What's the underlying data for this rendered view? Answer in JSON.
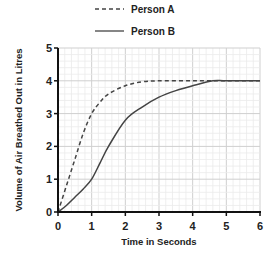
{
  "chart_data": {
    "type": "line",
    "title": "",
    "xlabel": "Time in Seconds",
    "ylabel": "Volume of Air Breathed Out in Litres",
    "xlim": [
      0,
      6
    ],
    "ylim": [
      0,
      5
    ],
    "xticks": [
      "0",
      "1",
      "2",
      "3",
      "4",
      "5",
      "6"
    ],
    "yticks": [
      "0",
      "1",
      "2",
      "3",
      "4",
      "5"
    ],
    "grid": true,
    "grid_minor_step": 0.2,
    "legend_position": "top",
    "series": [
      {
        "name": "Person A",
        "style": "dashed",
        "x": [
          0,
          0.25,
          0.5,
          0.75,
          1.0,
          1.25,
          1.5,
          2.0,
          2.5,
          3.0,
          4.0,
          5.0,
          6.0
        ],
        "y": [
          0,
          0.8,
          1.6,
          2.4,
          3.0,
          3.35,
          3.6,
          3.85,
          3.97,
          4.0,
          4.0,
          4.0,
          4.0
        ]
      },
      {
        "name": "Person B",
        "style": "solid",
        "x": [
          0,
          0.25,
          0.5,
          0.75,
          1.0,
          1.25,
          1.5,
          2.0,
          2.5,
          3.0,
          3.5,
          4.0,
          4.6,
          5.0,
          6.0
        ],
        "y": [
          0,
          0.2,
          0.45,
          0.7,
          1.0,
          1.5,
          2.0,
          2.8,
          3.2,
          3.5,
          3.7,
          3.85,
          4.0,
          4.0,
          4.0
        ]
      }
    ]
  },
  "legend": {
    "items": [
      {
        "label": "Person A"
      },
      {
        "label": "Person B"
      }
    ]
  },
  "colors": {
    "line": "#444444",
    "axis": "#111111",
    "grid_major": "#cfcfcf",
    "grid_minor": "#ebebeb"
  }
}
